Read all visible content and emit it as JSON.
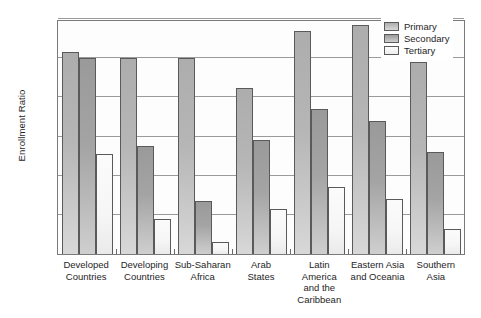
{
  "chart_data": {
    "type": "bar",
    "title": "",
    "subtitle": "",
    "xlabel": "",
    "ylabel": "Enrollment Ratio",
    "ylim": [
      0,
      120
    ],
    "yticks": [
      0,
      20,
      40,
      60,
      80,
      100,
      120
    ],
    "grid": true,
    "legend_position": "top-right",
    "categories": [
      "Developed\nCountries",
      "Developing\nCountries",
      "Sub-Saharan\nAfrica",
      "Arab\nStates",
      "Latin\nAmerica\nand the\nCaribbean",
      "Eastern Asia\nand Oceania",
      "Southern\nAsia"
    ],
    "category_lines": [
      [
        "Developed",
        "Countries"
      ],
      [
        "Developing",
        "Countries"
      ],
      [
        "Sub-Saharan",
        "Africa"
      ],
      [
        "Arab",
        "States"
      ],
      [
        "Latin",
        "America",
        "and the",
        "Caribbean"
      ],
      [
        "Eastern Asia",
        "and Oceania"
      ],
      [
        "Southern",
        "Asia"
      ]
    ],
    "series": [
      {
        "name": "Primary",
        "color": "#b6b6b6",
        "values": [
          103,
          100,
          100,
          85,
          114,
          117,
          98
        ]
      },
      {
        "name": "Secondary",
        "color": "#a4a4a4",
        "values": [
          100,
          55,
          27,
          58,
          74,
          68,
          52
        ]
      },
      {
        "name": "Tertiary",
        "color": "#f6f6f6",
        "values": [
          51,
          18,
          6,
          23,
          34,
          28,
          13
        ]
      }
    ]
  },
  "legend": {
    "items": [
      {
        "label": "Primary",
        "key": "primary"
      },
      {
        "label": "Secondary",
        "key": "secondary"
      },
      {
        "label": "Tertiary",
        "key": "tertiary"
      }
    ]
  }
}
